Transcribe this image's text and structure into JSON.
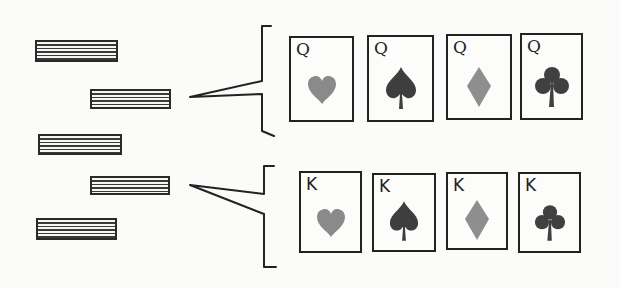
{
  "diagram": {
    "stacks": [
      {
        "id": "stack-1",
        "x": 35,
        "y": 40,
        "w": 83,
        "h": 22
      },
      {
        "id": "stack-2",
        "x": 90,
        "y": 89,
        "w": 81,
        "h": 20,
        "expanded_to": "queens"
      },
      {
        "id": "stack-3",
        "x": 38,
        "y": 134,
        "w": 84,
        "h": 21
      },
      {
        "id": "stack-4",
        "x": 90,
        "y": 176,
        "w": 80,
        "h": 19,
        "expanded_to": "kings"
      },
      {
        "id": "stack-5",
        "x": 36,
        "y": 218,
        "w": 81,
        "h": 22
      }
    ],
    "card_rows": [
      {
        "name": "queens",
        "cards": [
          {
            "rank": "Q",
            "suit": "hearts",
            "suit_color": "#8a8a8a",
            "x": 289,
            "y": 36,
            "w": 65,
            "h": 86
          },
          {
            "rank": "Q",
            "suit": "spades",
            "suit_color": "#3e3e3e",
            "x": 367,
            "y": 35,
            "w": 67,
            "h": 87
          },
          {
            "rank": "Q",
            "suit": "diamonds",
            "suit_color": "#8e8e8e",
            "x": 446,
            "y": 34,
            "w": 66,
            "h": 86
          },
          {
            "rank": "Q",
            "suit": "clubs",
            "suit_color": "#404040",
            "x": 520,
            "y": 33,
            "w": 63,
            "h": 87
          }
        ]
      },
      {
        "name": "kings",
        "cards": [
          {
            "rank": "K",
            "suit": "hearts",
            "suit_color": "#8a8a8a",
            "x": 299,
            "y": 171,
            "w": 63,
            "h": 82
          },
          {
            "rank": "K",
            "suit": "spades",
            "suit_color": "#3e3e3e",
            "x": 372,
            "y": 173,
            "w": 64,
            "h": 79
          },
          {
            "rank": "K",
            "suit": "diamonds",
            "suit_color": "#8e8e8e",
            "x": 446,
            "y": 172,
            "w": 62,
            "h": 78
          },
          {
            "rank": "K",
            "suit": "clubs",
            "suit_color": "#404040",
            "x": 518,
            "y": 172,
            "w": 63,
            "h": 81
          }
        ]
      }
    ],
    "colors": {
      "ink": "#222222",
      "paper": "#fbfbf9",
      "light_suit": "#8a8a8a",
      "dark_suit": "#3e3e3e"
    }
  }
}
